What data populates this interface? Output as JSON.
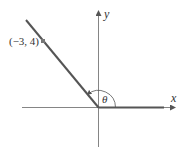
{
  "diagram": {
    "type": "angle-in-standard-position",
    "axes": {
      "x_label": "x",
      "y_label": "y"
    },
    "point": {
      "label": "(−3, 4)",
      "x": -3,
      "y": 4
    },
    "angle": {
      "label": "θ",
      "initial_side": "positive x-axis",
      "terminal_side": "through (−3, 4)"
    },
    "colors": {
      "ray": "#555555",
      "axis": "#666666",
      "point": "#777777",
      "text": "#333333"
    }
  }
}
